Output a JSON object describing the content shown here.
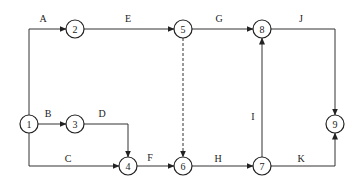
{
  "diagram": {
    "type": "activity-on-arrow network",
    "nodes": [
      {
        "id": "1",
        "label": "1",
        "x": 29,
        "y": 124
      },
      {
        "id": "2",
        "label": "2",
        "x": 75,
        "y": 29
      },
      {
        "id": "3",
        "label": "3",
        "x": 75,
        "y": 124
      },
      {
        "id": "4",
        "label": "4",
        "x": 128,
        "y": 166
      },
      {
        "id": "5",
        "label": "5",
        "x": 183,
        "y": 29
      },
      {
        "id": "6",
        "label": "6",
        "x": 183,
        "y": 166
      },
      {
        "id": "7",
        "label": "7",
        "x": 262,
        "y": 166
      },
      {
        "id": "8",
        "label": "8",
        "x": 262,
        "y": 29
      },
      {
        "id": "9",
        "label": "9",
        "x": 335,
        "y": 124
      }
    ],
    "edges": [
      {
        "label": "A",
        "from": "1",
        "to": "2",
        "dashed": false
      },
      {
        "label": "B",
        "from": "1",
        "to": "3",
        "dashed": false
      },
      {
        "label": "C",
        "from": "1",
        "to": "4",
        "dashed": false
      },
      {
        "label": "D",
        "from": "3",
        "to": "4",
        "dashed": false
      },
      {
        "label": "E",
        "from": "2",
        "to": "5",
        "dashed": false
      },
      {
        "label": "F",
        "from": "4",
        "to": "6",
        "dashed": false
      },
      {
        "label": "G",
        "from": "5",
        "to": "8",
        "dashed": false
      },
      {
        "label": "H",
        "from": "6",
        "to": "7",
        "dashed": false
      },
      {
        "label": "I",
        "from": "7",
        "to": "8",
        "dashed": false
      },
      {
        "label": "J",
        "from": "8",
        "to": "9",
        "dashed": false
      },
      {
        "label": "K",
        "from": "7",
        "to": "9",
        "dashed": false
      },
      {
        "label": "",
        "from": "5",
        "to": "6",
        "dashed": true
      }
    ]
  }
}
